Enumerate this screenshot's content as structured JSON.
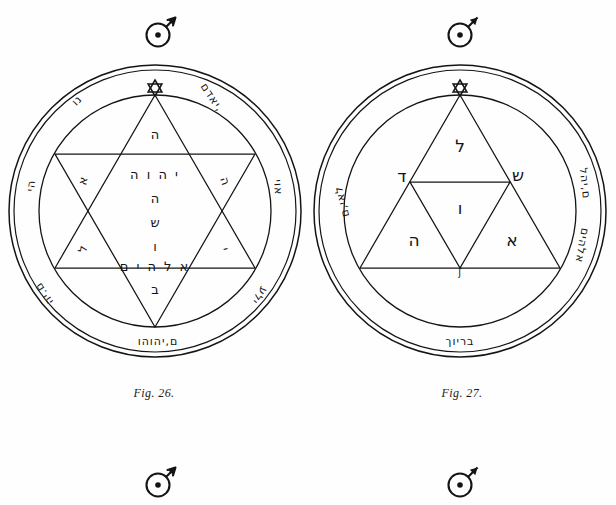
{
  "page": {
    "background_color": "#fefefe",
    "ink_color": "#141414",
    "width": 616,
    "height": 505
  },
  "figures": [
    {
      "id": "fig-26",
      "caption": "Fig. 26.",
      "top_symbol": "mars-symbol",
      "bottom_symbol": "mars-symbol",
      "apex_symbol": "hexagram-icon",
      "center_lines": [
        "ה",
        "י ה ו ה",
        "ה",
        "ש",
        "ו",
        "א ל ה י ם",
        "ב"
      ],
      "star_point_letters": {
        "upper_left": "א",
        "lower_left": "ל",
        "upper_right": "ה",
        "lower_right": "י"
      },
      "ring_inscriptions": {
        "top_left": "נו",
        "top_right": "יאדם,",
        "left_upper": "הי",
        "left_lower": "ם.יה",
        "right_upper": "אוי",
        "right_lower": "ילע",
        "bottom": "ם,יהוהו"
      }
    },
    {
      "id": "fig-27",
      "caption": "Fig. 27.",
      "top_symbol": "mars-symbol",
      "bottom_symbol": "mars-symbol",
      "apex_symbol": "hexagram-icon",
      "triangle_letters": {
        "top": "ל",
        "left": "ד",
        "right": "ש",
        "center": "ו",
        "lower_left": "ה",
        "lower_right": "א",
        "base_mark": "ʃ"
      },
      "ring_inscriptions": {
        "left": "לאי,ם",
        "right_upper": "ם,יהל",
        "right_lower": "אלהים",
        "bottom": "בריוך"
      }
    }
  ]
}
